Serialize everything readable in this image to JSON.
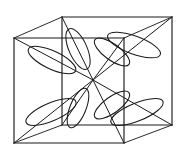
{
  "figure": {
    "background_color": "#ffffff",
    "line_color": "#1a1a1a",
    "width": 183,
    "height": 156
  },
  "cube": {
    "name": "cube-frame",
    "description": "Wire-frame cube drawn in oblique projection",
    "vertices": {
      "front_top_left": [
        14,
        38
      ],
      "front_top_right": [
        124,
        38
      ],
      "front_bottom_left": [
        14,
        143
      ],
      "front_bottom_right": [
        124,
        143
      ],
      "back_top_left": [
        62,
        17
      ],
      "back_top_right": [
        172,
        17
      ],
      "back_bottom_left": [
        62,
        125
      ],
      "back_bottom_right": [
        172,
        125
      ]
    },
    "edges": [
      {
        "name": "front-top-edge",
        "from": "front_top_left",
        "to": "front_top_right"
      },
      {
        "name": "front-right-edge",
        "from": "front_top_right",
        "to": "front_bottom_right"
      },
      {
        "name": "front-bottom-edge",
        "from": "front_bottom_right",
        "to": "front_bottom_left"
      },
      {
        "name": "front-left-edge",
        "from": "front_bottom_left",
        "to": "front_top_left"
      },
      {
        "name": "back-top-edge",
        "from": "back_top_left",
        "to": "back_top_right"
      },
      {
        "name": "back-right-edge",
        "from": "back_top_right",
        "to": "back_bottom_right"
      },
      {
        "name": "back-bottom-edge",
        "from": "back_bottom_right",
        "to": "back_bottom_left"
      },
      {
        "name": "back-left-edge",
        "from": "back_bottom_left",
        "to": "back_top_left"
      },
      {
        "name": "connector-top-left",
        "from": "front_top_left",
        "to": "back_top_left"
      },
      {
        "name": "connector-top-right",
        "from": "front_top_right",
        "to": "back_top_right"
      },
      {
        "name": "connector-bottom-left",
        "from": "front_bottom_left",
        "to": "back_bottom_left"
      },
      {
        "name": "connector-bottom-right",
        "from": "front_bottom_right",
        "to": "back_bottom_right"
      }
    ]
  },
  "center": {
    "name": "body-center",
    "point": [
      93,
      80
    ]
  },
  "diagonals": [
    {
      "name": "diagonal-to-front-top-left",
      "to": [
        14,
        38
      ]
    },
    {
      "name": "diagonal-to-front-top-right",
      "to": [
        124,
        38
      ]
    },
    {
      "name": "diagonal-to-front-bottom-left",
      "to": [
        14,
        143
      ]
    },
    {
      "name": "diagonal-to-front-bottom-right",
      "to": [
        124,
        143
      ]
    },
    {
      "name": "diagonal-to-back-top-left",
      "to": [
        62,
        17
      ]
    },
    {
      "name": "diagonal-to-back-top-right",
      "to": [
        172,
        17
      ]
    },
    {
      "name": "diagonal-to-back-bottom-left",
      "to": [
        62,
        125
      ]
    },
    {
      "name": "diagonal-to-back-bottom-right",
      "to": [
        172,
        125
      ]
    }
  ],
  "lobes": {
    "count": 8,
    "shape": "elongated-ellipse",
    "items": [
      {
        "name": "lobe-front-top-left",
        "cx": 52,
        "cy": 60,
        "rx": 26,
        "ry": 9,
        "rotation": 25
      },
      {
        "name": "lobe-back-top-left",
        "cx": 78,
        "cy": 49,
        "rx": 22,
        "ry": 9,
        "rotation": 66
      },
      {
        "name": "lobe-back-top-right",
        "cx": 112,
        "cy": 52,
        "rx": 21,
        "ry": 8,
        "rotation": 36
      },
      {
        "name": "lobe-front-top-right",
        "cx": 134,
        "cy": 45,
        "rx": 28,
        "ry": 9,
        "rotation": 20
      },
      {
        "name": "lobe-front-bottom-left",
        "cx": 51,
        "cy": 112,
        "rx": 27,
        "ry": 9,
        "rotation": -23
      },
      {
        "name": "lobe-back-bottom-left",
        "cx": 78,
        "cy": 108,
        "rx": 21,
        "ry": 8,
        "rotation": -68
      },
      {
        "name": "lobe-back-bottom-right",
        "cx": 112,
        "cy": 105,
        "rx": 21,
        "ry": 8,
        "rotation": -36
      },
      {
        "name": "lobe-front-bottom-right",
        "cx": 137,
        "cy": 112,
        "rx": 28,
        "ry": 9,
        "rotation": -22
      }
    ]
  }
}
